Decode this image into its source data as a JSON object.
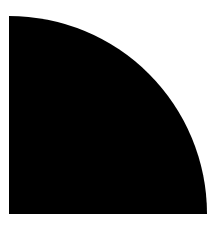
{
  "figure": {
    "shape": "quarter-circle",
    "fill_color": "#000000",
    "background_color": "#ffffff",
    "center": {
      "x": 9,
      "y": 214
    },
    "radius": 198
  }
}
